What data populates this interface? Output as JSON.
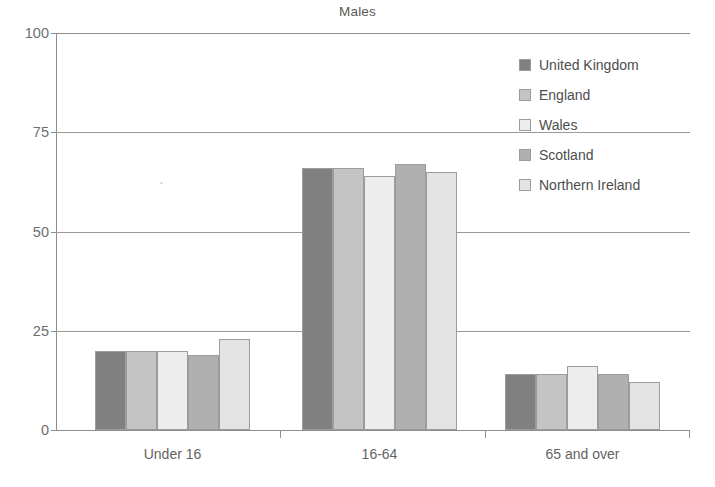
{
  "chart_data": {
    "type": "bar",
    "title": "Males",
    "xlabel": "",
    "ylabel": "",
    "categories": [
      "Under 16",
      "16-64",
      "65 and over"
    ],
    "series": [
      {
        "name": "United Kingdom",
        "color": "#808080",
        "values": [
          20,
          66,
          14
        ]
      },
      {
        "name": "England",
        "color": "#c4c4c4",
        "values": [
          20,
          66,
          14
        ]
      },
      {
        "name": "Wales",
        "color": "#ededed",
        "values": [
          20,
          64,
          16
        ]
      },
      {
        "name": "Scotland",
        "color": "#b0b0b0",
        "values": [
          19,
          67,
          14
        ]
      },
      {
        "name": "Northern Ireland",
        "color": "#e3e3e3",
        "values": [
          23,
          65,
          12
        ]
      }
    ],
    "ylim": [
      0,
      100
    ],
    "yticks": [
      0,
      25,
      50,
      75,
      100
    ],
    "ytick_labels": [
      "0",
      "25",
      "50",
      "75",
      "100"
    ],
    "grid": "horizontal",
    "legend_position": "top-right"
  },
  "axis": {
    "y_ticks": [
      "100",
      "75",
      "50",
      "25",
      "0"
    ]
  },
  "legend": {
    "items": [
      {
        "label": "United Kingdom"
      },
      {
        "label": "England"
      },
      {
        "label": "Wales"
      },
      {
        "label": "Scotland"
      },
      {
        "label": "Northern Ireland"
      }
    ]
  }
}
